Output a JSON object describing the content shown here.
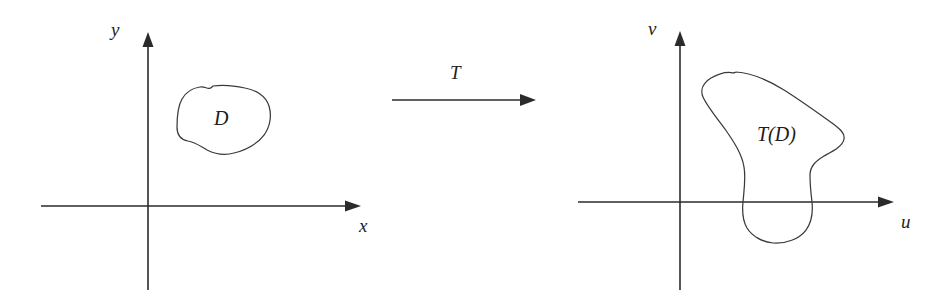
{
  "figure": {
    "background_color": "#ffffff",
    "ink_color": "#2b2b2b",
    "curve_color": "#3a3a3a"
  },
  "left_plane": {
    "name": "xy-plane",
    "vertical_axis_label": "y",
    "horizontal_axis_label": "x",
    "region_label": "D"
  },
  "mapping": {
    "label": "T",
    "arrow_direction": "right"
  },
  "right_plane": {
    "name": "uv-plane",
    "vertical_axis_label": "v",
    "horizontal_axis_label": "u",
    "region_label": "T(D)"
  }
}
